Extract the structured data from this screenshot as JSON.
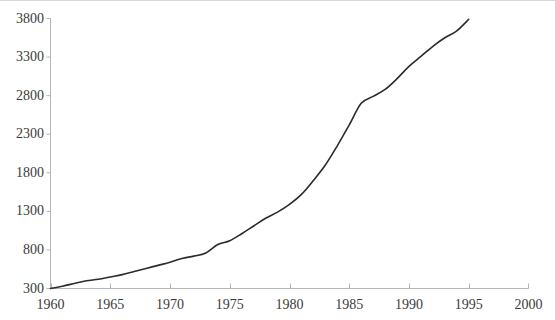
{
  "chart_data": {
    "type": "line",
    "title": "",
    "subtitle": "",
    "xlabel": "",
    "ylabel": "",
    "xlim": [
      1960,
      2000
    ],
    "ylim": [
      300,
      3800
    ],
    "grid": false,
    "legend": null,
    "legend_position": "none",
    "line_color": "#2b2b2b",
    "axis_color": "#b5b5b5",
    "tick_label_color": "#3b3b3b",
    "background_color": "#ffffff",
    "x_ticks": [
      1960,
      1965,
      1970,
      1975,
      1980,
      1985,
      1990,
      1995,
      2000
    ],
    "x_tick_labels": [
      "1960",
      "1965",
      "1970",
      "1975",
      "1980",
      "1985",
      "1990",
      "1995",
      "2000"
    ],
    "y_ticks": [
      300,
      800,
      1300,
      1800,
      2300,
      2800,
      3300,
      3800
    ],
    "y_tick_labels": [
      "300",
      "800",
      "1300",
      "1800",
      "2300",
      "2800",
      "3300",
      "3800"
    ],
    "series": [
      {
        "name": "series-1",
        "x": [
          1960,
          1961,
          1962,
          1963,
          1964,
          1965,
          1966,
          1967,
          1968,
          1969,
          1970,
          1971,
          1972,
          1973,
          1974,
          1975,
          1976,
          1977,
          1978,
          1979,
          1980,
          1981,
          1982,
          1983,
          1984,
          1985,
          1986,
          1987,
          1988,
          1989,
          1990,
          1991,
          1992,
          1993,
          1994,
          1995
        ],
        "values": [
          300,
          330,
          365,
          400,
          420,
          450,
          480,
          520,
          560,
          600,
          640,
          690,
          720,
          760,
          870,
          920,
          1010,
          1110,
          1210,
          1290,
          1390,
          1520,
          1700,
          1900,
          2150,
          2420,
          2700,
          2790,
          2880,
          3020,
          3180,
          3310,
          3440,
          3550,
          3640,
          3790
        ]
      }
    ]
  }
}
